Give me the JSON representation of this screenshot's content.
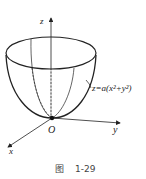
{
  "figure": {
    "caption_prefix": "图",
    "caption_number": "1-29",
    "surface_equation": "z=a(x²+y²)",
    "axes": {
      "x_label": "x",
      "y_label": "y",
      "z_label": "z",
      "origin_label": "O"
    },
    "colors": {
      "stroke": "#222222",
      "text": "#222222",
      "background": "#ffffff"
    }
  }
}
